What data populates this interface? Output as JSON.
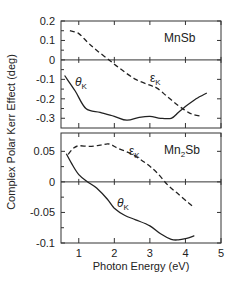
{
  "chart_data": [
    {
      "type": "line",
      "title": "MnSb",
      "xlabel": "Photon Energy (eV)",
      "ylabel": "Complex Polar Kerr Effect (deg)",
      "xlim": [
        0.5,
        5
      ],
      "ylim": [
        -0.35,
        0.2
      ],
      "yticks": [
        0.2,
        0.1,
        0,
        -0.1,
        -0.2,
        -0.3
      ],
      "ytick_labels": [
        "0.2",
        "0.1",
        "0",
        "-0.1",
        "-0.2",
        "-0.3"
      ],
      "grid": false,
      "zero_line": true,
      "series": [
        {
          "name": "εK",
          "style": "dashed",
          "x": [
            0.75,
            1.0,
            1.25,
            1.5,
            1.85,
            2.2,
            2.6,
            3.0,
            3.2,
            3.5,
            3.8,
            4.0,
            4.2,
            4.45
          ],
          "y": [
            0.15,
            0.135,
            0.09,
            0.05,
            0.0,
            -0.05,
            -0.1,
            -0.13,
            -0.145,
            -0.19,
            -0.235,
            -0.26,
            -0.28,
            -0.29
          ]
        },
        {
          "name": "θK",
          "style": "solid",
          "x": [
            0.6,
            0.9,
            1.2,
            1.6,
            2.0,
            2.35,
            2.7,
            3.0,
            3.3,
            3.6,
            3.8,
            4.0,
            4.3,
            4.6
          ],
          "y": [
            -0.08,
            -0.16,
            -0.25,
            -0.27,
            -0.29,
            -0.31,
            -0.295,
            -0.29,
            -0.3,
            -0.3,
            -0.27,
            -0.24,
            -0.2,
            -0.17
          ]
        }
      ],
      "annotations": [
        {
          "text": "MnSb",
          "x": 4.25,
          "y": 0.11
        },
        {
          "text": "θK",
          "x": 0.85,
          "y": -0.13
        },
        {
          "text": "εK",
          "x": 3.3,
          "y": -0.11
        }
      ]
    },
    {
      "type": "line",
      "title": "Mn2Sb",
      "xlabel": "Photon Energy (eV)",
      "ylabel": "Complex Polar Kerr Effect (deg)",
      "xlim": [
        0.5,
        5
      ],
      "ylim": [
        -0.1,
        0.08
      ],
      "xticks": [
        1,
        2,
        3,
        4,
        5
      ],
      "xtick_labels": [
        "1",
        "2",
        "3",
        "4",
        "5"
      ],
      "yticks": [
        0.05,
        0,
        -0.05,
        -0.1
      ],
      "ytick_labels": [
        "0.05",
        "0",
        "-0.05",
        "-0.1"
      ],
      "grid": false,
      "zero_line": true,
      "series": [
        {
          "name": "εK",
          "style": "dashed",
          "x": [
            0.7,
            0.85,
            1.0,
            1.3,
            1.6,
            1.85,
            2.1,
            2.5,
            2.9,
            3.2,
            3.5,
            3.8,
            4.1,
            4.25
          ],
          "y": [
            0.045,
            0.055,
            0.059,
            0.058,
            0.06,
            0.062,
            0.055,
            0.045,
            0.03,
            0.015,
            -0.005,
            -0.02,
            -0.035,
            -0.042
          ]
        },
        {
          "name": "θK",
          "style": "solid",
          "x": [
            0.65,
            0.8,
            1.0,
            1.25,
            1.5,
            1.8,
            2.0,
            2.3,
            2.6,
            3.0,
            3.3,
            3.6,
            3.8,
            4.0,
            4.25
          ],
          "y": [
            0.046,
            0.03,
            0.012,
            0.0,
            -0.01,
            -0.028,
            -0.043,
            -0.055,
            -0.062,
            -0.072,
            -0.085,
            -0.094,
            -0.095,
            -0.093,
            -0.088
          ]
        }
      ],
      "annotations": [
        {
          "text": "Mn2Sb",
          "x": 4.2,
          "y": 0.052
        },
        {
          "text": "εK",
          "x": 3.0,
          "y": 0.058
        },
        {
          "text": "θK",
          "x": 2.55,
          "y": -0.035
        }
      ]
    }
  ],
  "labels": {
    "ylabel": "Complex Polar Kerr Effect (deg)",
    "xlabel": "Photon Energy (eV)",
    "top_material": "MnSb",
    "bottom_material_main": "Mn",
    "bottom_material_sub": "2",
    "bottom_material_tail": "Sb",
    "theta_main": "θ",
    "theta_sub": "K",
    "eps_main": "ε",
    "eps_sub": "K"
  }
}
